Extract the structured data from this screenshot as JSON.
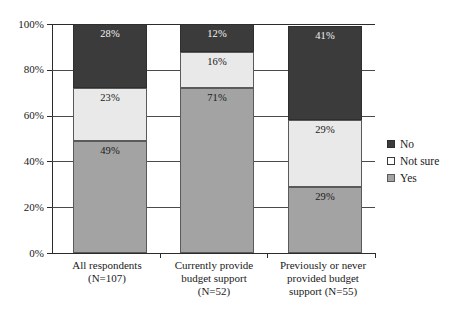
{
  "chart_data": {
    "type": "bar",
    "subtype": "100% stacked column",
    "title": "",
    "subtitle": "",
    "xlabel": "",
    "ylabel": "",
    "ylim": [
      0,
      100
    ],
    "y_unit": "%",
    "grid": true,
    "legend_position": "right",
    "stack_order_bottom_to_top": [
      "Yes",
      "Not sure",
      "No"
    ],
    "categories": [
      "All respondents (N=107)",
      "Currently provide budget support (N=52)",
      "Previously or never provided budget support (N=55)"
    ],
    "category_lines": [
      [
        "All respondents",
        "(N=107)"
      ],
      [
        "Currently provide",
        "budget support",
        "(N=52)"
      ],
      [
        "Previously or never",
        "provided budget",
        "support (N=55)"
      ]
    ],
    "series": [
      {
        "name": "No",
        "color": "#3b3b3b",
        "values": [
          28,
          12,
          41
        ]
      },
      {
        "name": "Not sure",
        "color": "#e9e9e9",
        "values": [
          23,
          16,
          29
        ]
      },
      {
        "name": "Yes",
        "color": "#a3a3a3",
        "values": [
          49,
          71,
          29
        ]
      }
    ],
    "data_labels": [
      {
        "category": "All respondents (N=107)",
        "No": "28%",
        "Not sure": "23%",
        "Yes": "49%"
      },
      {
        "category": "Currently provide budget support (N=52)",
        "No": "12%",
        "Not sure": "16%",
        "Yes": "71%"
      },
      {
        "category": "Previously or never provided budget support (N=55)",
        "No": "41%",
        "Not sure": "29%",
        "Yes": "29%"
      }
    ],
    "y_ticks": [
      "0%",
      "20%",
      "40%",
      "60%",
      "80%",
      "100%"
    ],
    "y_tick_values": [
      0,
      20,
      40,
      60,
      80,
      100
    ]
  },
  "axis": {
    "y_ticks": [
      {
        "label": "100%",
        "value": 100
      },
      {
        "label": "80%",
        "value": 80
      },
      {
        "label": "60%",
        "value": 60
      },
      {
        "label": "40%",
        "value": 40
      },
      {
        "label": "20%",
        "value": 20
      },
      {
        "label": "0%",
        "value": 0
      }
    ]
  },
  "bars": [
    {
      "name": "all-respondents",
      "label_lines": [
        "All respondents",
        "(N=107)"
      ],
      "segments": [
        {
          "key": "no",
          "label": "28%",
          "value": 28
        },
        {
          "key": "not-sure",
          "label": "23%",
          "value": 23
        },
        {
          "key": "yes",
          "label": "49%",
          "value": 49
        }
      ]
    },
    {
      "name": "currently-provide-budget-support",
      "label_lines": [
        "Currently provide",
        "budget support",
        "(N=52)"
      ],
      "segments": [
        {
          "key": "no",
          "label": "12%",
          "value": 12
        },
        {
          "key": "not-sure",
          "label": "16%",
          "value": 16
        },
        {
          "key": "yes",
          "label": "71%",
          "value": 71
        }
      ]
    },
    {
      "name": "previously-or-never-provided-budget-support",
      "label_lines": [
        "Previously or never",
        "provided budget",
        "support (N=55)"
      ],
      "segments": [
        {
          "key": "no",
          "label": "41%",
          "value": 41
        },
        {
          "key": "not-sure",
          "label": "29%",
          "value": 29
        },
        {
          "key": "yes",
          "label": "29%",
          "value": 29
        }
      ]
    }
  ],
  "legend": {
    "items": [
      {
        "key": "no",
        "label": "No",
        "color": "#3b3b3b"
      },
      {
        "key": "not-sure",
        "label": "Not sure",
        "color": "#ffffff"
      },
      {
        "key": "yes",
        "label": "Yes",
        "color": "#a3a3a3"
      }
    ]
  },
  "colors": {
    "no": "#3b3b3b",
    "not_sure": "#e9e9e9",
    "yes": "#a3a3a3",
    "axis": "#2b2b2b",
    "grid": "#4a4a4a",
    "background": "#ffffff"
  }
}
